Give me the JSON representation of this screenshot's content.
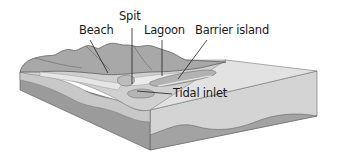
{
  "diagram": {
    "type": "coastal-landforms-block-diagram",
    "labels": {
      "beach": "Beach",
      "spit": "Spit",
      "lagoon": "Lagoon",
      "barrier_island": "Barrier island",
      "tidal_inlet": "Tidal inlet"
    },
    "colors": {
      "background": "#ffffff",
      "land_dark": "#8e8e8e",
      "land_mid": "#b0b0b0",
      "land_light": "#c8c8c8",
      "sand": "#dcdcdc",
      "water_surface": "#e4e4e4",
      "side_upper": "#d2d2d2",
      "side_lower": "#9a9a9a",
      "outline": "#555555",
      "leader_line": "#222222"
    }
  }
}
